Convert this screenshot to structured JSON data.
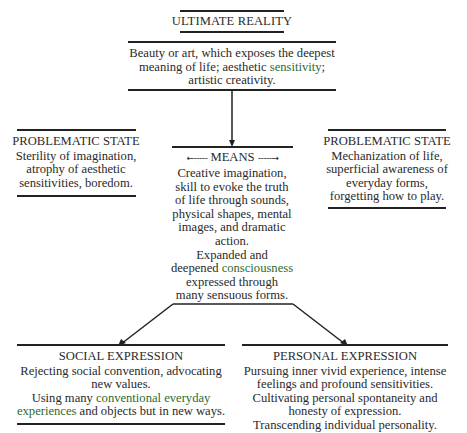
{
  "diagram": {
    "top": {
      "title": "ULTIMATE REALITY",
      "lines": [
        "Beauty or art, which exposes the deepest",
        "meaning of life; aesthetic ",
        "sensitivity",
        ";",
        "artistic creativity."
      ]
    },
    "left_problem": {
      "title": "PROBLEMATIC STATE",
      "lines": [
        "Sterility of imagination,",
        "atrophy of aesthetic",
        "sensitivities, boredom."
      ]
    },
    "right_problem": {
      "title": "PROBLEMATIC STATE",
      "lines": [
        "Mechanization of life,",
        "superficial awareness of",
        "everyday forms,",
        "forgetting how to play."
      ]
    },
    "means": {
      "title": "MEANS",
      "left_arrow": "←-----",
      "right_arrow": "-----→",
      "lines": [
        "Creative imagination,",
        "skill to evoke the truth",
        "of life through sounds,",
        "physical shapes, mental",
        "images, and dramatic",
        "action.",
        "Expanded and",
        "deepened ",
        "consciousness",
        "expressed through",
        "many sensuous forms."
      ]
    },
    "social": {
      "title": "SOCIAL EXPRESSION",
      "lines": [
        "Rejecting social convention, advocating",
        "new values.",
        "Using many ",
        "conventional everyday",
        "experiences",
        " and objects but in new ways."
      ]
    },
    "personal": {
      "title": "PERSONAL EXPRESSION",
      "lines": [
        "Pursuing inner vivid experience, intense",
        "feelings and profound sensitivities.",
        "Cultivating personal spontaneity and",
        "honesty of expression.",
        "Transcending individual personality."
      ]
    },
    "colors": {
      "text": "#2a2a2a",
      "lines": "#222222",
      "highlight": "#2e6b2e"
    }
  }
}
